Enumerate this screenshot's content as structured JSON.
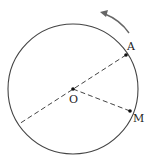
{
  "diagram": {
    "type": "geometry-circle",
    "circle": {
      "cx": 73,
      "cy": 89,
      "r": 65
    },
    "points": {
      "O": {
        "label": "O",
        "x": 73,
        "y": 89
      },
      "A": {
        "label": "A",
        "x": 126,
        "y": 55
      },
      "M": {
        "label": "M",
        "x": 130,
        "y": 111
      }
    },
    "segments": [
      {
        "from": "A",
        "to": "diameter-end",
        "style": "dashed"
      },
      {
        "from": "O",
        "to": "M",
        "style": "dashed"
      }
    ],
    "rotation_arrow": {
      "direction": "counterclockwise"
    }
  },
  "colors": {
    "stroke": "#444444",
    "arrow": "#666666"
  }
}
